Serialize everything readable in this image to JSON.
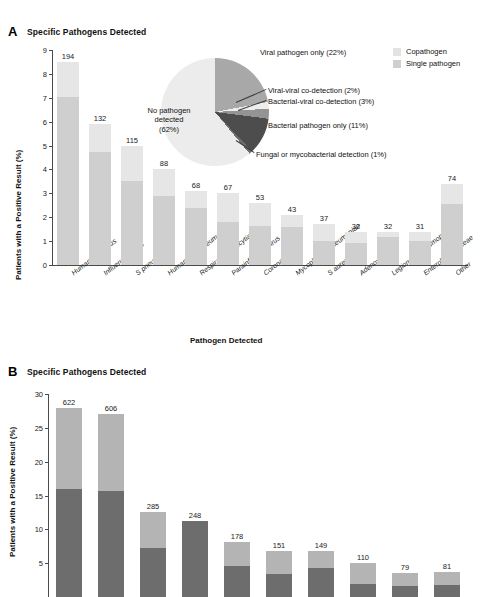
{
  "figure": {
    "panels": [
      {
        "letter": "A",
        "title": "Specific Pathogens Detected",
        "ylabel": "Patients with a Positive Result (%)",
        "xlabel": "Pathogen Detected"
      },
      {
        "letter": "B",
        "title": "Specific Pathogens Detected",
        "ylabel": "Patients with a Positive Result (%)"
      }
    ]
  },
  "legend": {
    "items": [
      {
        "label": "Copathogen",
        "color": "#e3e3e3"
      },
      {
        "label": "Single pathogen",
        "color": "#cfcfcf"
      }
    ]
  },
  "chart_data": [
    {
      "type": "bar",
      "panel": "A",
      "title": "Specific Pathogens Detected",
      "xlabel": "Pathogen Detected",
      "ylabel": "Patients with a Positive Result (%)",
      "ylim": [
        0,
        9
      ],
      "yticks": [
        0,
        1,
        2,
        3,
        4,
        5,
        6,
        7,
        8,
        9
      ],
      "grid": false,
      "legend_position": "top-right",
      "stacked": true,
      "categories": [
        "Human rhinovirus",
        "Influenza A or B",
        "S pneumoniae",
        "Human metapneumovirus",
        "Respiratory syncytial virus",
        "Parainfluenza virus",
        "Coronavirus",
        "Mycoplasma pneumoniae",
        "S aureus",
        "Adenovirus",
        "Legionella pneumophila",
        "Enterobacteriaceae",
        "Other"
      ],
      "counts": [
        194,
        132,
        115,
        88,
        68,
        67,
        53,
        43,
        37,
        32,
        32,
        31,
        74
      ],
      "series": [
        {
          "name": "Single pathogen",
          "color": "#cfcfcf",
          "values": [
            7.05,
            4.75,
            3.5,
            2.9,
            2.4,
            1.78,
            1.62,
            1.6,
            1.02,
            0.93,
            1.18,
            1.02,
            2.55
          ]
        },
        {
          "name": "Copathogen",
          "color": "#e6e6e6",
          "values": [
            1.45,
            1.15,
            1.5,
            1.1,
            0.7,
            1.22,
            0.98,
            0.5,
            0.68,
            0.47,
            0.22,
            0.38,
            0.85
          ]
        }
      ],
      "totals": [
        8.5,
        5.9,
        5.0,
        4.0,
        3.1,
        3.0,
        2.6,
        2.1,
        1.7,
        1.4,
        1.4,
        1.4,
        3.4
      ]
    },
    {
      "type": "pie",
      "panel": "A",
      "title": "Pathogen detection overview",
      "slices": [
        {
          "label": "Viral pathogen only (22%)",
          "value": 22,
          "color": "#a8a8a8"
        },
        {
          "label": "Viral-viral co-detection (2%)",
          "value": 2,
          "color": "#ededed"
        },
        {
          "label": "Bacterial-viral co-detection (3%)",
          "value": 3,
          "color": "#949494"
        },
        {
          "label": "Bacterial pathogen only (11%)",
          "value": 11,
          "color": "#4d4d4d"
        },
        {
          "label": "Fungal or mycobacterial detection (1%)",
          "value": 1,
          "color": "#6e6e6e"
        },
        {
          "label": "No pathogen detected (62%)",
          "value": 62,
          "color": "#ececec"
        }
      ],
      "center_label_lines": [
        "No pathogen",
        "detected",
        "(62%)"
      ]
    },
    {
      "type": "bar",
      "panel": "B",
      "title": "Specific Pathogens Detected",
      "ylabel": "Patients with a Positive Result (%)",
      "ylim": [
        0,
        30
      ],
      "yticks": [
        0,
        5,
        10,
        15,
        20,
        25,
        30
      ],
      "grid": false,
      "stacked": true,
      "note": "Panel B is cropped at the bottom of the screenshot; x-axis category labels are not visible.",
      "counts": [
        622,
        606,
        285,
        248,
        178,
        151,
        149,
        110,
        79,
        81
      ],
      "series": [
        {
          "name": "Single pathogen",
          "color": "#6d6d6d",
          "values": [
            15.9,
            15.6,
            7.2,
            11.2,
            4.6,
            3.4,
            4.3,
            1.9,
            1.6,
            1.7
          ]
        },
        {
          "name": "Copathogen",
          "color": "#b4b4b4",
          "values": [
            12.1,
            11.4,
            5.4,
            0.0,
            3.5,
            3.4,
            2.5,
            3.1,
            2.0,
            2.0
          ]
        }
      ],
      "totals": [
        28.0,
        27.0,
        12.6,
        11.2,
        8.1,
        6.8,
        6.8,
        5.0,
        3.6,
        3.7
      ]
    }
  ]
}
